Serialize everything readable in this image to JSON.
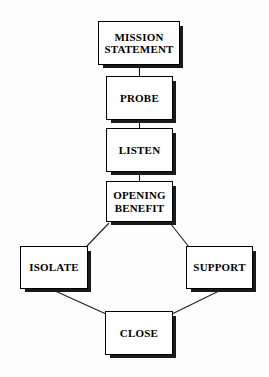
{
  "diagram": {
    "background_color": "#fdfdfd",
    "box_fill_color": "#ffffff",
    "box_border_color": "#000000",
    "box_shadow_color": "#1a1a1a",
    "text_color": "#000000",
    "nodes": [
      {
        "id": "mission-statement",
        "label": "MISSION\nSTATEMENT",
        "x": 98,
        "y": 21,
        "w": 82,
        "h": 44
      },
      {
        "id": "probe",
        "label": "PROBE",
        "x": 106,
        "y": 76,
        "w": 67,
        "h": 44
      },
      {
        "id": "listen",
        "label": "LISTEN",
        "x": 106,
        "y": 128,
        "w": 67,
        "h": 44
      },
      {
        "id": "opening-benefit",
        "label": "OPENING\nBENEFIT",
        "x": 106,
        "y": 181,
        "w": 67,
        "h": 41
      },
      {
        "id": "isolate",
        "label": "ISOLATE",
        "x": 20,
        "y": 246,
        "w": 68,
        "h": 43
      },
      {
        "id": "support",
        "label": "SUPPORT",
        "x": 186,
        "y": 246,
        "w": 67,
        "h": 43
      },
      {
        "id": "close",
        "label": "CLOSE",
        "x": 105,
        "y": 311,
        "w": 68,
        "h": 44
      }
    ],
    "edges": [
      {
        "id": "mission-statement-to-probe",
        "from": "mission-statement",
        "to": "probe",
        "kind": "vertical",
        "x1": 139,
        "y1": 65,
        "x2": 139,
        "y2": 76
      },
      {
        "id": "probe-to-listen",
        "from": "probe",
        "to": "listen",
        "kind": "vertical",
        "x1": 139,
        "y1": 120,
        "x2": 139,
        "y2": 128
      },
      {
        "id": "listen-to-opening-benefit",
        "from": "listen",
        "to": "opening-benefit",
        "kind": "vertical",
        "x1": 139,
        "y1": 172,
        "x2": 139,
        "y2": 181
      },
      {
        "id": "opening-benefit-to-isolate",
        "from": "opening-benefit",
        "to": "isolate",
        "kind": "diagonal",
        "x1": 108,
        "y1": 222,
        "x2": 87,
        "y2": 246
      },
      {
        "id": "opening-benefit-to-support",
        "from": "opening-benefit",
        "to": "support",
        "kind": "diagonal",
        "x1": 171,
        "y1": 222,
        "x2": 190,
        "y2": 246
      },
      {
        "id": "isolate-to-close",
        "from": "isolate",
        "to": "close",
        "kind": "diagonal",
        "x1": 52,
        "y1": 289,
        "x2": 106,
        "y2": 313
      },
      {
        "id": "support-to-close",
        "from": "support",
        "to": "close",
        "kind": "diagonal",
        "x1": 222,
        "y1": 289,
        "x2": 172,
        "y2": 313
      }
    ]
  }
}
